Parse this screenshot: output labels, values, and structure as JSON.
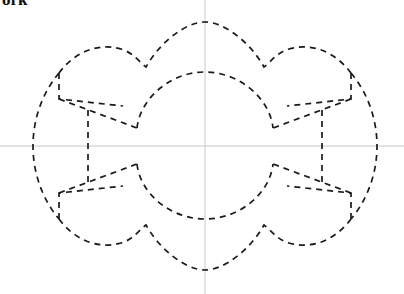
{
  "page": {
    "title_fragment": "ork",
    "background_color": "#ffffff"
  },
  "canvas": {
    "width": 404,
    "height": 294
  },
  "centerlines": {
    "color": "#c8c8c8",
    "stroke_width": 1,
    "horizontal": {
      "label": "horizontal-centerline",
      "x1": 0,
      "y1": 146,
      "x2": 404,
      "y2": 146
    },
    "vertical": {
      "label": "vertical-centerline",
      "x1": 205,
      "y1": 0,
      "x2": 205,
      "y2": 294
    }
  },
  "drawing": {
    "title": "Hidden-line part outline",
    "line_style": "dashed",
    "line_color": "#1a1a1a",
    "stroke_width": 1.7,
    "dash_pattern": "6 5",
    "center": {
      "x": 205,
      "y": 146
    },
    "outer_extents": {
      "left": 33,
      "right": 377,
      "top": 22,
      "bottom": 270
    },
    "inner_circle": {
      "cx": 205,
      "cy": 146,
      "r": 74
    },
    "paths": {
      "outer_top_arc": "M 121 49 C 155 24 200 21 205 22 C 243 22 282 32 309 53",
      "outer_left_arc": "M 59 73 C 41 94 33 120 33 146 C 33 172 41 198 59 219",
      "outer_right_arc": "M 351 73 C 369 94 377 120 377 146 C 377 172 369 198 351 219",
      "outer_bottom_arc": "M 121 243 C 155 268 200 271 205 270 C 243 270 282 260 309 239",
      "inner_top_arc": "M 132 175 M 134 131 C 138 104 168 73 205 72 C 242 73 272 104 276 131",
      "inner_bottom_arc": "M 134 161 C 138 188 168 219 205 219 C 242 219 272 188 276 161",
      "lobe_top_left": "M 59 73 L 59 98 L 125 105 L 137 128 L 106 128 L 106 105 L 59 98",
      "lobe_top_right": "M 351 73 L 351 98 L 285 105 L 273 128 L 304 128 L 304 105 L 351 98",
      "lobe_bottom_left": "M 59 219 L 59 194 L 125 187 L 137 164 L 106 164 L 106 187 L 59 194",
      "lobe_bottom_right": "M 351 219 L 351 194 L 285 187 L 273 164 L 304 164 L 304 187 L 351 194",
      "notch_left_vertical": "M 88 113 L 88 180",
      "notch_right_vertical": "M 322 113 L 322 180"
    }
  }
}
